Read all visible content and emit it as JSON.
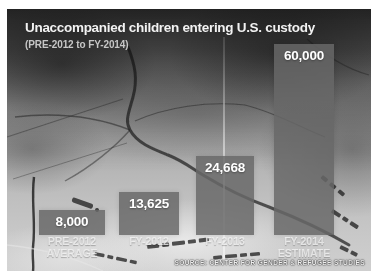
{
  "header": {
    "title": "Unaccompanied children entering U.S. custody",
    "subtitle": "(PRE-2012 to FY-2014)"
  },
  "source_line": "SOURCE: CENTER FOR GENDER & REFUGEE STUDIES",
  "colors": {
    "bar": "rgba(104,104,104,0.84)",
    "title_text": "#f2f2f2",
    "subtitle_text": "#c6c6c6",
    "value_text": "#ffffff",
    "category_text": "rgba(244,244,244,0.78)",
    "background_frame": "#ffffff"
  },
  "chart_data": {
    "type": "bar",
    "title": "Unaccompanied children entering U.S. custody",
    "subtitle": "(PRE-2012 to FY-2014)",
    "categories": [
      "PRE-2012 AVERAGE",
      "FY-2012",
      "FY-2013",
      "FY-2014 ESTIMATE"
    ],
    "category_lines": [
      [
        "PRE-2012",
        "AVERAGE"
      ],
      [
        "FY-2012"
      ],
      [
        "FY-2013"
      ],
      [
        "FY-2014",
        "ESTIMATE"
      ]
    ],
    "values": [
      8000,
      13625,
      24668,
      60000
    ],
    "value_labels": [
      "8,000",
      "13,625",
      "24,668",
      "60,000"
    ],
    "ylim": [
      0,
      60000
    ],
    "grid": false,
    "legend": false,
    "value_label_position": "inside-top",
    "source": "SOURCE: CENTER FOR GENDER & REFUGEE STUDIES",
    "background": "grayscale road map photograph"
  }
}
